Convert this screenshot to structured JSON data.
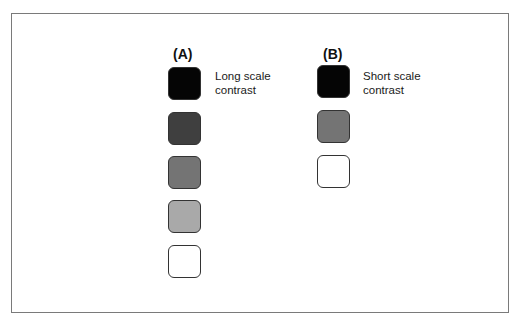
{
  "figure": {
    "panels": [
      {
        "label": "(A)",
        "caption_line1": "Long scale",
        "caption_line2": "contrast",
        "swatches": [
          {
            "name": "black",
            "color": "#050505"
          },
          {
            "name": "dark-gray",
            "color": "#3f3f3f"
          },
          {
            "name": "medium-gray",
            "color": "#747474"
          },
          {
            "name": "light-gray",
            "color": "#a9a9a9"
          },
          {
            "name": "white",
            "color": "#ffffff"
          }
        ]
      },
      {
        "label": "(B)",
        "caption_line1": "Short scale",
        "caption_line2": "contrast",
        "swatches": [
          {
            "name": "black",
            "color": "#050505"
          },
          {
            "name": "medium-gray",
            "color": "#747474"
          },
          {
            "name": "white",
            "color": "#ffffff"
          }
        ]
      }
    ],
    "frame_color": "#7a7a7a"
  }
}
